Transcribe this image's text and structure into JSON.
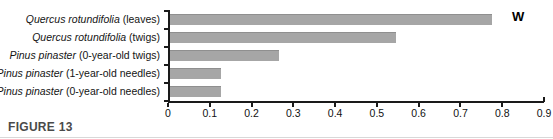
{
  "figure": {
    "caption": "FIGURE 13",
    "annotation": "W"
  },
  "chart_data": {
    "type": "bar",
    "orientation": "horizontal",
    "title": "",
    "xlabel": "",
    "ylabel": "",
    "xlim": [
      0,
      0.9
    ],
    "xticks": [
      "0",
      "0.1",
      "0.2",
      "0.3",
      "0.4",
      "0.5",
      "0.6",
      "0.7",
      "0.8",
      "0.9"
    ],
    "xtick_values": [
      0,
      0.1,
      0.2,
      0.3,
      0.4,
      0.5,
      0.6,
      0.7,
      0.8,
      0.9
    ],
    "grid": false,
    "legend": false,
    "bar_color": "#a6a6a6",
    "axis_color": "#1a1a1a",
    "categories": [
      {
        "species": "Quercus rotundifolia",
        "part": " (leaves)",
        "full": "Quercus rotundifolia (leaves)",
        "value": 0.775
      },
      {
        "species": "Quercus rotundifolia",
        "part": " (twigs)",
        "full": "Quercus rotundifolia (twigs)",
        "value": 0.545
      },
      {
        "species": "Pinus pinaster",
        "part": " (0-year-old twigs)",
        "full": "Pinus pinaster (0-year-old twigs)",
        "value": 0.265
      },
      {
        "species": "Pinus pinaster",
        "part": " (1-year-old needles)",
        "full": "Pinus pinaster (1-year-old needles)",
        "value": 0.128
      },
      {
        "species": "Pinus pinaster",
        "part": " (0-year-old needles)",
        "full": "Pinus pinaster (0-year-old needles)",
        "value": 0.128
      }
    ],
    "values": [
      0.775,
      0.545,
      0.265,
      0.128,
      0.128
    ]
  }
}
